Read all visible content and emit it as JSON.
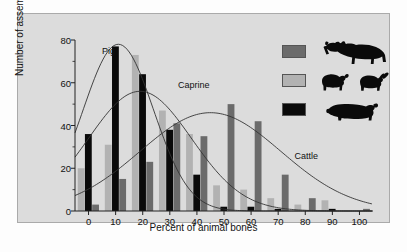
{
  "chart_data": {
    "type": "bar",
    "title": "",
    "xlabel": "Percent of animal bones",
    "ylabel": "Number of assemblages",
    "xlim": [
      -5,
      105
    ],
    "ylim": [
      0,
      80
    ],
    "yticks": [
      0,
      20,
      40,
      60,
      80
    ],
    "xticks": [
      0,
      10,
      20,
      30,
      40,
      50,
      60,
      70,
      80,
      90,
      100
    ],
    "grid": false,
    "legend_position": "top-right",
    "categories": [
      0,
      10,
      20,
      30,
      40,
      50,
      60,
      70,
      80,
      90,
      100
    ],
    "series": [
      {
        "name": "Caprine",
        "color": "#b2b2b2",
        "values": [
          20,
          31,
          73,
          47,
          36,
          12,
          10,
          6,
          3,
          5,
          0
        ]
      },
      {
        "name": "Pig",
        "color": "#0a0a0a",
        "values": [
          36,
          77,
          64,
          38,
          17,
          2,
          2,
          1,
          0,
          1,
          0
        ]
      },
      {
        "name": "Cattle",
        "color": "#6b6b6b",
        "values": [
          3,
          15,
          23,
          41,
          35,
          50,
          42,
          17,
          6,
          0,
          1
        ]
      }
    ],
    "curves": [
      {
        "name": "Pig",
        "peak_x": 11,
        "peak_y": 78,
        "width": 13
      },
      {
        "name": "Caprine",
        "peak_x": 19,
        "peak_y": 56,
        "width": 19
      },
      {
        "name": "Cattle",
        "peak_x": 45,
        "peak_y": 46,
        "width": 26
      }
    ],
    "annotations": [
      {
        "text": "Pig",
        "x": 5,
        "y": 74
      },
      {
        "text": "Caprine",
        "x": 33,
        "y": 58
      },
      {
        "text": "Cattle",
        "x": 76,
        "y": 25
      }
    ]
  },
  "legend": {
    "items": [
      {
        "label": "Cattle",
        "swatch_color": "#6b6b6b",
        "icon": "cow-icon"
      },
      {
        "label": "Caprine",
        "swatch_color": "#b2b2b2",
        "icon": "sheep-goat-icon"
      },
      {
        "label": "Pig",
        "swatch_color": "#0a0a0a",
        "icon": "pig-icon"
      }
    ]
  },
  "axes": {
    "y_tick_labels": [
      "0",
      "20",
      "40",
      "60",
      "80"
    ],
    "x_tick_labels": [
      "0",
      "10",
      "20",
      "30",
      "40",
      "50",
      "60",
      "70",
      "80",
      "90",
      "100"
    ],
    "x_title": "Percent of animal bones",
    "y_title": "Number of assemblages"
  },
  "colors": {
    "panel_background": "#dcdcdc",
    "figure_background": "#fdfdfd",
    "axis": "#222222",
    "curve": "#333333"
  }
}
